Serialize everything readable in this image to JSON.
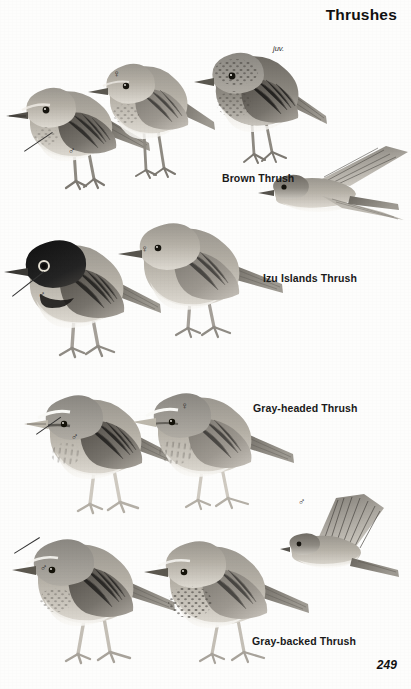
{
  "page": {
    "title": "Thrushes",
    "page_number": "249",
    "background_color": "#fdfdfc",
    "ink_color": "#1a1a1a",
    "plate_type": "field-guide-illustration-plate",
    "color_mode": "grayscale"
  },
  "symbols": {
    "male": "♂",
    "female": "♀",
    "juvenile_label": "juv."
  },
  "panels": [
    {
      "id": "brown-thrush",
      "species_label": "Brown Thrush",
      "figures": [
        {
          "name": "male-perched",
          "sex": "♂",
          "pose": "perched-left",
          "has_leader_line": true
        },
        {
          "name": "female-perched",
          "sex": "♀",
          "pose": "perched-left",
          "has_leader_line": false
        },
        {
          "name": "juvenile-perched",
          "sex": "",
          "pose": "perched-left",
          "annotation": "juv.",
          "has_leader_line": false
        },
        {
          "name": "flight-figure",
          "sex": "",
          "pose": "in-flight",
          "has_leader_line": false
        }
      ]
    },
    {
      "id": "izu-islands-thrush",
      "species_label": "Izu Islands Thrush",
      "figures": [
        {
          "name": "male-perched",
          "sex": "♂",
          "pose": "perched-left",
          "has_leader_line": true
        },
        {
          "name": "female-perched",
          "sex": "♀",
          "pose": "perched-left",
          "has_leader_line": false
        }
      ]
    },
    {
      "id": "gray-headed-thrush",
      "species_label": "Gray-headed Thrush",
      "figures": [
        {
          "name": "male-perched",
          "sex": "♂",
          "pose": "perched-left",
          "has_leader_line": true
        },
        {
          "name": "female-perched",
          "sex": "♀",
          "pose": "perched-left",
          "has_leader_line": false
        }
      ]
    },
    {
      "id": "gray-backed-thrush",
      "species_label": "Gray-backed Thrush",
      "figures": [
        {
          "name": "male-perched",
          "sex": "♂",
          "pose": "perched-left",
          "has_leader_line": true
        },
        {
          "name": "female-perched",
          "sex": "",
          "pose": "perched-left",
          "has_leader_line": false
        },
        {
          "name": "male-flight",
          "sex": "♂",
          "pose": "in-flight",
          "has_leader_line": false
        }
      ]
    }
  ]
}
